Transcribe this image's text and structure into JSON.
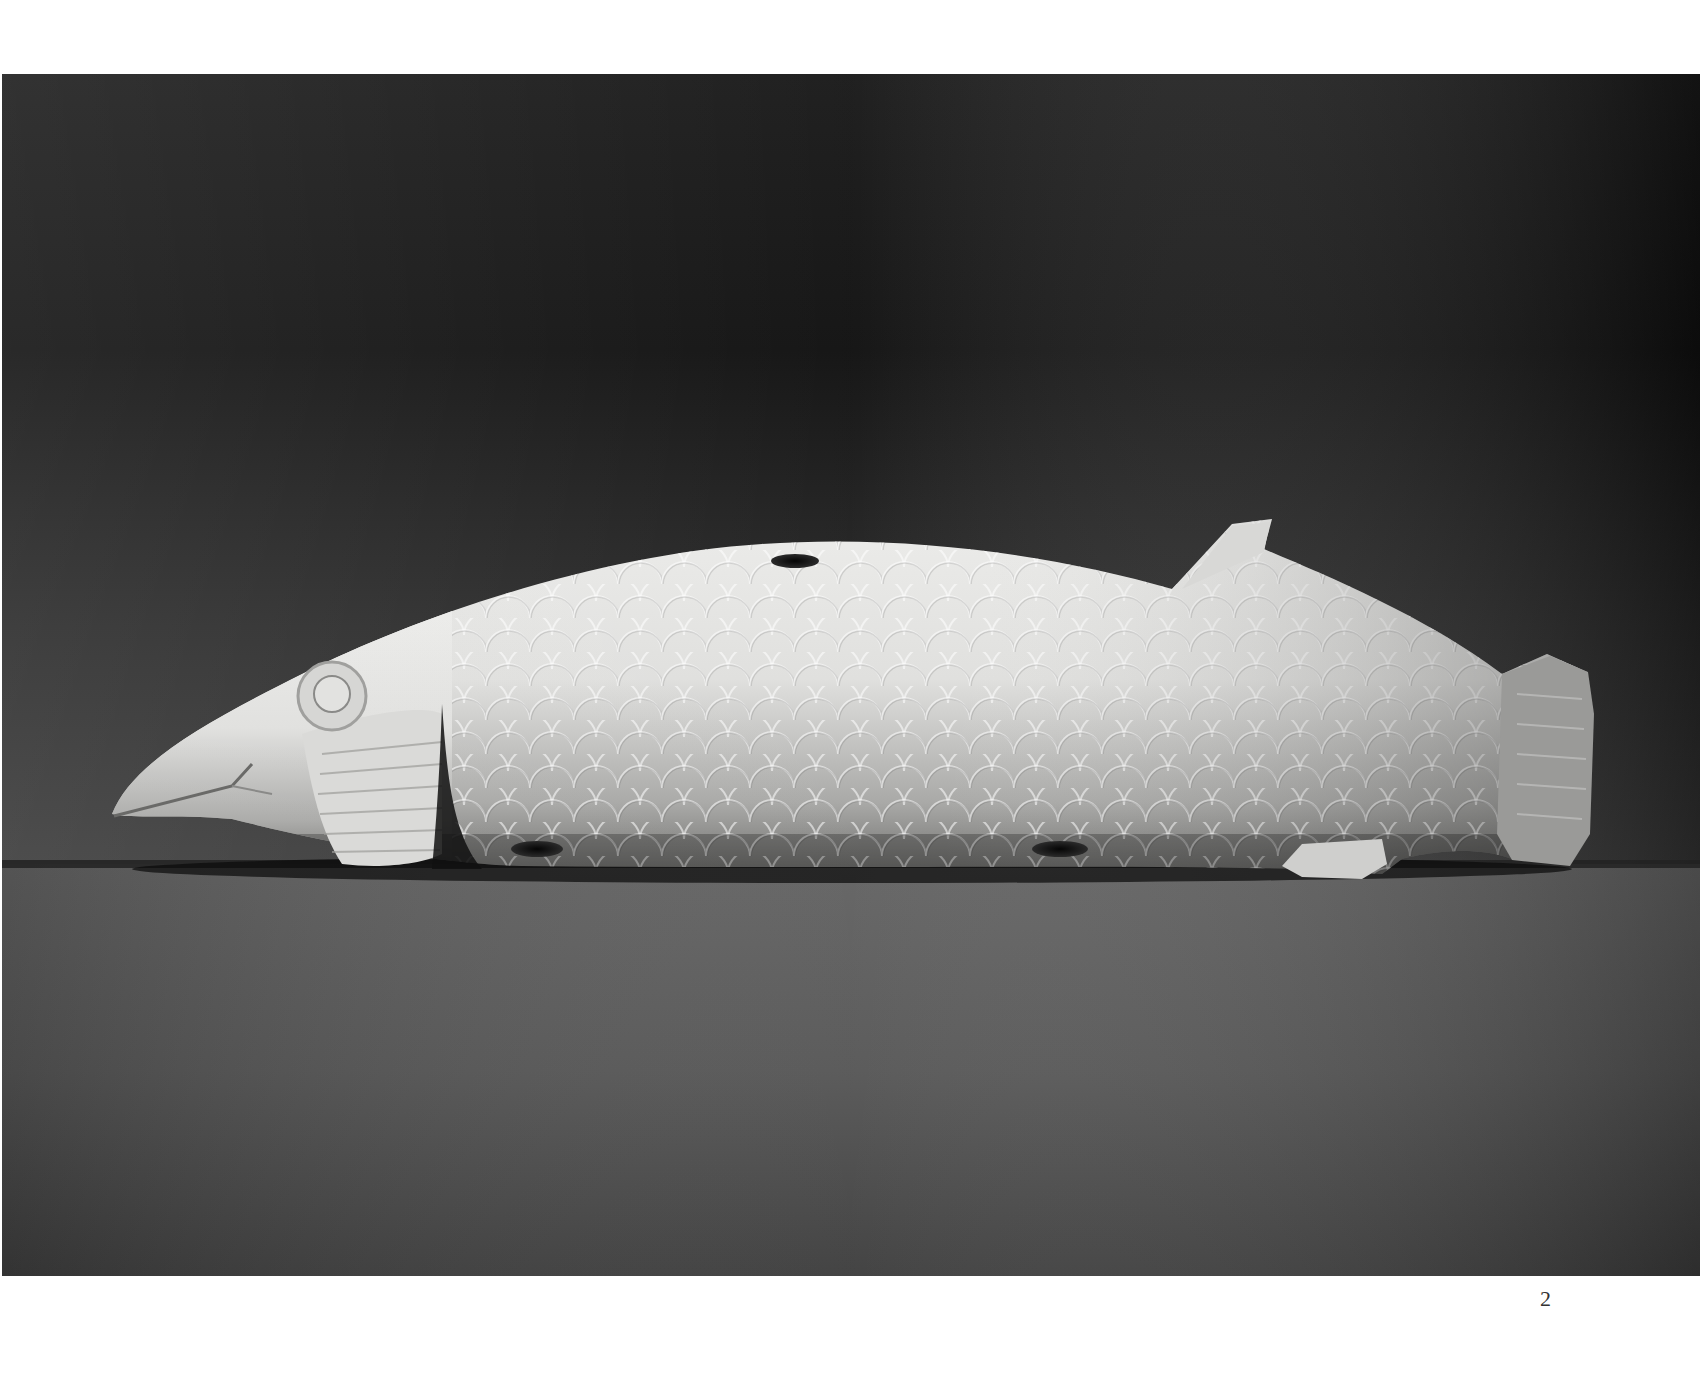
{
  "page": {
    "page_number": "2"
  },
  "photo": {
    "subject": "carved stone fish sculpture",
    "alt": "Black and white photograph of a carved white stone fish lying on its side, with incised scales, a round eye, incised mouth and fins, and drilled holes",
    "colors": {
      "backdrop_top": "#0e0e0e",
      "backdrop_mid": "#2a2a2a",
      "floor": "#5a5a5a",
      "floor_bottom": "#3e3e3e",
      "fish_light": "#e6e6e4",
      "fish_shadow": "#7a7a78",
      "horizon_line": "#222222"
    }
  }
}
